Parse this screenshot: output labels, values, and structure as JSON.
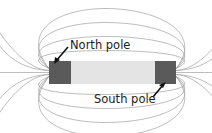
{
  "diagram": {
    "type": "bar-magnet-field",
    "labels": {
      "north": "North pole",
      "south": "South pole"
    },
    "colors": {
      "pole": "#5a5a5a",
      "body": "#e4e4e4",
      "field_line": "#9a9a9a",
      "arrow": "#111111",
      "text": "#222222"
    }
  }
}
